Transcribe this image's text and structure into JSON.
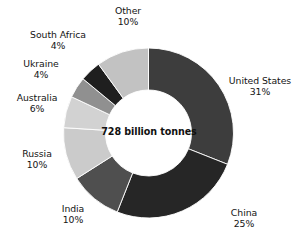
{
  "chart_data": {
    "type": "pie",
    "variant": "donut",
    "title": "",
    "subtitle": "",
    "xlabel": "",
    "ylabel": "",
    "center_label": "728 billion tonnes",
    "total": "728 billion tonnes",
    "units": "billion tonnes",
    "grid": false,
    "legend": "none",
    "labels_position": "outside",
    "start_angle_deg": 0,
    "direction": "clockwise",
    "categories": [
      "United States",
      "China",
      "India",
      "Russia",
      "Australia",
      "Ukraine",
      "South Africa",
      "Other"
    ],
    "values": [
      31,
      25,
      10,
      10,
      6,
      4,
      4,
      10
    ],
    "value_suffix": "%",
    "slices": [
      {
        "label": "United States",
        "value": 31,
        "value_text": "31%",
        "color": "#3d3d3d"
      },
      {
        "label": "China",
        "value": 25,
        "value_text": "25%",
        "color": "#262626"
      },
      {
        "label": "India",
        "value": 10,
        "value_text": "10%",
        "color": "#4f4f4f"
      },
      {
        "label": "Russia",
        "value": 10,
        "value_text": "10%",
        "color": "#cbcbcb"
      },
      {
        "label": "Australia",
        "value": 6,
        "value_text": "6%",
        "color": "#d2d2d2"
      },
      {
        "label": "Ukraine",
        "value": 4,
        "value_text": "4%",
        "color": "#909090"
      },
      {
        "label": "South Africa",
        "value": 4,
        "value_text": "4%",
        "color": "#1f1f1f"
      },
      {
        "label": "Other",
        "value": 10,
        "value_text": "10%",
        "color": "#c2c2c2"
      }
    ]
  },
  "colors": {
    "background": "#ffffff",
    "text": "#141414",
    "center_text": "#111111",
    "slice_united_states": "#3d3d3d",
    "slice_china": "#262626",
    "slice_india": "#4f4f4f",
    "slice_russia": "#cbcbcb",
    "slice_australia": "#d2d2d2",
    "slice_ukraine": "#909090",
    "slice_south_africa": "#1f1f1f",
    "slice_other": "#c2c2c2"
  }
}
